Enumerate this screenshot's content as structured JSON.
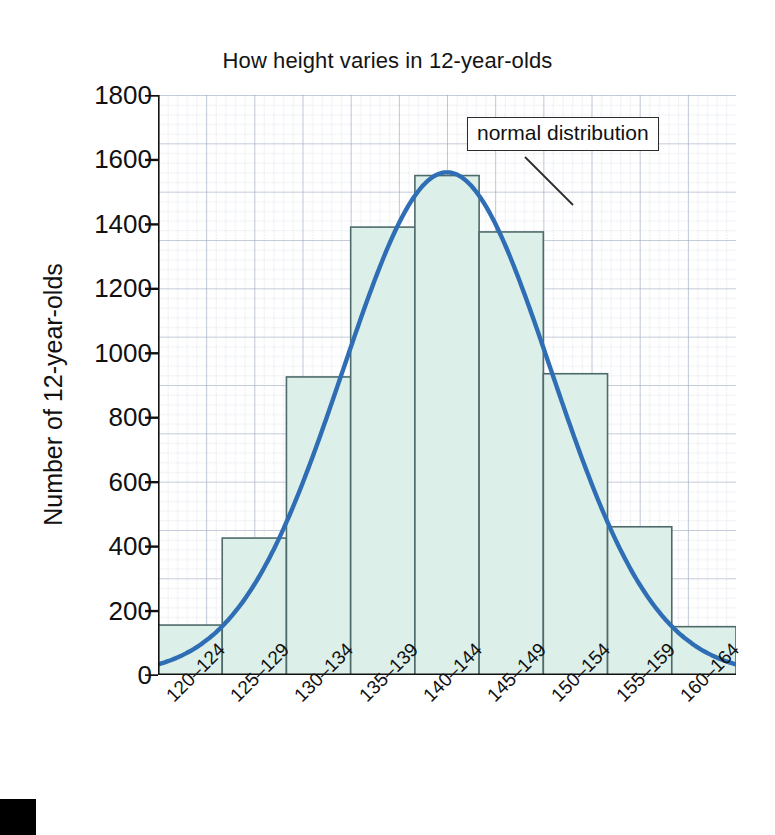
{
  "chart_data": {
    "type": "bar",
    "title": "How height varies in 12-year-olds",
    "xlabel": "Height groups (cm)",
    "ylabel": "Number of 12-year-olds",
    "categories": [
      "120–124",
      "125–129",
      "130–134",
      "135–139",
      "140–144",
      "145–149",
      "150–154",
      "155–159",
      "160–164"
    ],
    "values": [
      155,
      425,
      925,
      1390,
      1550,
      1375,
      935,
      460,
      150
    ],
    "ylim": [
      0,
      1800
    ],
    "yticks": [
      0,
      200,
      400,
      600,
      800,
      1000,
      1200,
      1400,
      1600,
      1800
    ],
    "ytick_labels": [
      "0",
      "200",
      "400",
      "600",
      "800",
      "1000",
      "1200",
      "1400",
      "1600",
      "1800"
    ],
    "grid": "graph-paper minor dotted grid, major light grid",
    "legend_position": "none",
    "annotations": [
      {
        "label": "normal distribution",
        "target": "overlaid normal distribution curve"
      }
    ],
    "overlay_curve": {
      "name": "normal distribution",
      "mean_category_index": 4,
      "peak_value": 1560,
      "color": "#2f6eb5"
    },
    "colors": {
      "bar_fill": "#dcefe9",
      "bar_edge": "#4e6a6a",
      "curve": "#2f6eb5",
      "axis": "#111111",
      "grid_minor": "#b9c2d6",
      "grid_major": "#9aa6c0",
      "text": "#111111"
    }
  },
  "labels": {
    "title": "How height varies in 12-year-olds",
    "y_axis_title": "Number of 12-year-olds",
    "x_axis_title": "Height groups (cm)",
    "annotation": "normal distribution"
  }
}
